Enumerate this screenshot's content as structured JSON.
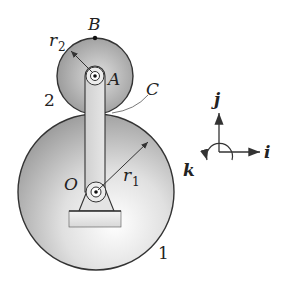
{
  "figure": {
    "colors": {
      "stroke": "#333333",
      "gear_light": "#f2f2f2",
      "gear_dark": "#8c8c8c",
      "background": "#ffffff"
    }
  },
  "labels": {
    "point_B": "B",
    "point_A": "A",
    "point_C": "C",
    "point_O": "O",
    "radius_2": "r",
    "radius_2_sub": "2",
    "radius_1": "r",
    "radius_1_sub": "1",
    "gear_2": "2",
    "gear_1": "1"
  },
  "axes": {
    "j": "j",
    "i": "i",
    "k": "k"
  }
}
